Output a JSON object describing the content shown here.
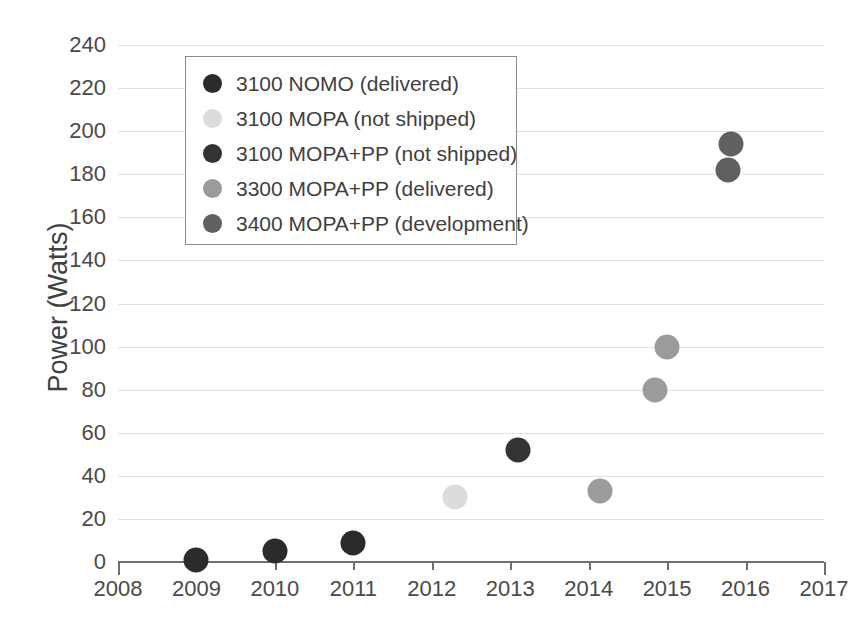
{
  "chart_data": {
    "type": "scatter",
    "title": "",
    "xlabel": "",
    "ylabel": "Power (Watts)",
    "xlim": [
      2008,
      2017
    ],
    "ylim": [
      0,
      240
    ],
    "grid": true,
    "legend_position": "upper-left",
    "x_ticks": [
      "2008",
      "2009",
      "2010",
      "2011",
      "2012",
      "2013",
      "2014",
      "2015",
      "2016",
      "2017"
    ],
    "y_ticks": [
      "0",
      "20",
      "40",
      "60",
      "80",
      "100",
      "120",
      "140",
      "160",
      "180",
      "200",
      "220",
      "240"
    ],
    "series": [
      {
        "name": "3100 NOMO (delivered)",
        "color": "#2b2b2b",
        "points": [
          {
            "x": 2009.0,
            "y": 1
          },
          {
            "x": 2010.0,
            "y": 5
          },
          {
            "x": 2011.0,
            "y": 9
          }
        ]
      },
      {
        "name": "3100 MOPA (not shipped)",
        "color": "#dcdcdc",
        "points": [
          {
            "x": 2012.3,
            "y": 30
          }
        ]
      },
      {
        "name": "3100 MOPA+PP (not shipped)",
        "color": "#333333",
        "points": [
          {
            "x": 2013.1,
            "y": 52
          }
        ]
      },
      {
        "name": "3300 MOPA+PP (delivered)",
        "color": "#9b9b9b",
        "points": [
          {
            "x": 2014.15,
            "y": 33
          },
          {
            "x": 2014.85,
            "y": 80
          },
          {
            "x": 2015.0,
            "y": 100
          }
        ]
      },
      {
        "name": "3400 MOPA+PP (development)",
        "color": "#606060",
        "points": [
          {
            "x": 2015.82,
            "y": 194
          },
          {
            "x": 2015.78,
            "y": 182
          }
        ]
      }
    ]
  },
  "legend": {
    "items": [
      {
        "label": "3100 NOMO (delivered)",
        "color": "#2b2b2b"
      },
      {
        "label": "3100 MOPA (not shipped)",
        "color": "#dcdcdc"
      },
      {
        "label": "3100 MOPA+PP (not shipped)",
        "color": "#333333"
      },
      {
        "label": "3300 MOPA+PP (delivered)",
        "color": "#9b9b9b"
      },
      {
        "label": "3400 MOPA+PP (development)",
        "color": "#606060"
      }
    ]
  }
}
